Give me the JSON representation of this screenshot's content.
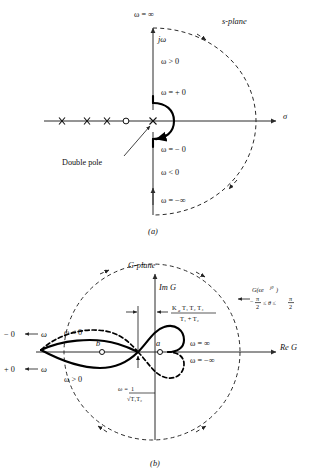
{
  "figure": {
    "panels": [
      {
        "id": "a",
        "caption": "(a)",
        "plane_label": "s-plane",
        "vertical_axis_label": "jω",
        "horizontal_axis_label": "σ",
        "labels": {
          "omega_inf_top": "ω = ∞",
          "omega_positive": "ω > 0",
          "omega_plus_zero": "ω = + 0",
          "omega_minus_zero": "ω = − 0",
          "omega_negative": "ω < 0",
          "omega_minus_inf": "ω = −∞",
          "double_pole": "Double pole"
        },
        "pole_zero": {
          "poles_symbol": "x",
          "zero_symbol": "o",
          "pole_count_left_axis": 3,
          "zero_count_left_axis": 1,
          "origin_marker": "double-pole-x"
        }
      },
      {
        "id": "b",
        "caption": "(b)",
        "plane_label": "G-plane",
        "vertical_axis_label": "Im G",
        "horizontal_axis_label": "Re G",
        "labels": {
          "minus_zero_arrow": "− 0",
          "plus_zero_arrow": "+ 0",
          "omega_left_upper": "ω",
          "omega_left_lower": "ω",
          "omega_negative": "ω < 0",
          "omega_positive": "ω > 0",
          "omega_inf": "ω = ∞",
          "omega_minus_inf": "ω = −∞",
          "point_a": "a",
          "point_b": "b",
          "omega_resonance_lead": "ω =",
          "omega_resonance_num": "1",
          "omega_resonance_den": "√T₁T₂",
          "gain_num": "K",
          "gain_num_sub": "a",
          "gain_num_rest": "T₁ T₂ T₄",
          "gain_den": "T₁ + T₂",
          "g_epsilon": "G(ϵe",
          "g_epsilon_sup": "jθ",
          "g_epsilon_close": ")",
          "theta_range": "−  ≤ θ ≤",
          "theta_range_frac_left_num": "π",
          "theta_range_frac_left_den": "2",
          "theta_range_frac_right_num": "π",
          "theta_range_frac_right_den": "2"
        }
      }
    ],
    "colors": {
      "ink": "#111111",
      "axis": "#2b2b2b",
      "background": "#ffffff"
    }
  }
}
